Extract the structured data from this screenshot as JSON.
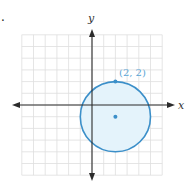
{
  "figure": {
    "marker": ".",
    "x_axis_label": "x",
    "y_axis_label": "y",
    "point_label": "(2, 2)",
    "grid": {
      "xmin": -6,
      "xmax": 6,
      "ymin": -6,
      "ymax": 6,
      "step": 1
    },
    "circle": {
      "center": [
        2,
        -1
      ],
      "radius": 3,
      "point_on_circle": [
        2,
        2
      ]
    },
    "colors": {
      "axis": "#2b2b2b",
      "grid": "#dedede",
      "circle_stroke": "#3b8fc9",
      "circle_fill": "#e4f3fb",
      "point": "#3b8fc9",
      "point_label": "#5aa6d6"
    }
  }
}
